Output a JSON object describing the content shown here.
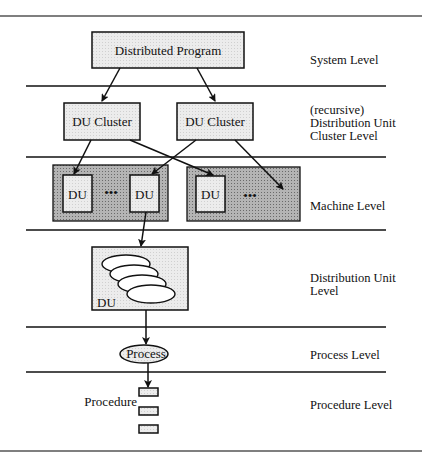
{
  "diagram": {
    "nodes": {
      "program": "Distributed Program",
      "cluster_left": "DU Cluster",
      "cluster_right": "DU Cluster",
      "du_1": "DU",
      "du_2": "DU",
      "du_3": "DU",
      "ellipsis": "•••",
      "du_detail": "DU",
      "process": "Process",
      "procedure": "Procedure"
    },
    "levels": [
      {
        "label": "System Level"
      },
      {
        "label": "(recursive)\nDistribution Unit\nCluster Level",
        "lines": [
          "(recursive)",
          "Distribution Unit",
          "Cluster Level"
        ]
      },
      {
        "label": "Machine Level"
      },
      {
        "label": "Distribution Unit Level",
        "lines": [
          "Distribution Unit",
          "Level"
        ]
      },
      {
        "label": "Process Level"
      },
      {
        "label": "Procedure Level"
      }
    ],
    "colors": {
      "box_fill": "#e6e6e6",
      "machine_fill": "#a8a8a8",
      "stroke": "#111111"
    }
  }
}
